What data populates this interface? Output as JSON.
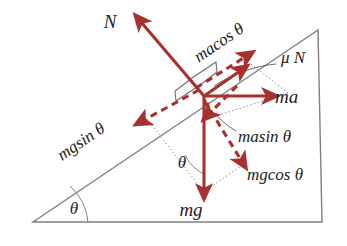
{
  "figure": {
    "type": "free-body-force-diagram",
    "background_color": "#ffffff",
    "force_color": "#a8302f",
    "geometry_color": "#6e6e6e"
  },
  "incline": {
    "name": "inclined-plane-triangle",
    "base_angle_label": "θ",
    "vertices": {
      "left": [
        33,
        222
      ],
      "apex": [
        318,
        30
      ],
      "right": [
        322,
        222
      ]
    }
  },
  "block": {
    "name": "block-on-incline",
    "center": [
      196,
      88
    ]
  },
  "forces": [
    {
      "id": "normal",
      "label": "N",
      "style": "solid",
      "direction": "perpendicular-away-from-incline",
      "label_pos": [
        110,
        28
      ]
    },
    {
      "id": "friction",
      "label": "μ N",
      "style": "solid",
      "direction": "up-the-incline",
      "label_pos": [
        281,
        63
      ]
    },
    {
      "id": "applied",
      "label": "ma",
      "style": "solid",
      "direction": "horizontal-right",
      "label_pos": [
        275,
        103
      ]
    },
    {
      "id": "weight",
      "label": "mg",
      "style": "solid",
      "direction": "vertically-down",
      "label_pos": [
        191,
        212
      ]
    },
    {
      "id": "applied-parallel",
      "label": "macos θ",
      "style": "dashed",
      "direction": "up-the-incline",
      "label_pos": [
        222,
        47
      ],
      "rotation_deg": -34
    },
    {
      "id": "applied-perpendicular",
      "label": "masin θ",
      "style": "dashed",
      "direction": "into-the-incline",
      "label_pos": [
        238,
        136
      ]
    },
    {
      "id": "weight-parallel",
      "label": "mgsin θ",
      "style": "dashed",
      "direction": "down-the-incline",
      "label_pos": [
        84,
        146
      ],
      "rotation_deg": -34
    },
    {
      "id": "weight-perpendicular",
      "label": "mgcos θ",
      "style": "dashed",
      "direction": "into-the-incline",
      "label_pos": [
        247,
        174
      ]
    }
  ],
  "angles": [
    {
      "id": "incline-base-angle",
      "label": "θ",
      "label_pos": [
        74,
        210
      ]
    },
    {
      "id": "weight-decomposition-angle",
      "label": "θ",
      "label_pos": [
        182,
        163
      ]
    }
  ]
}
